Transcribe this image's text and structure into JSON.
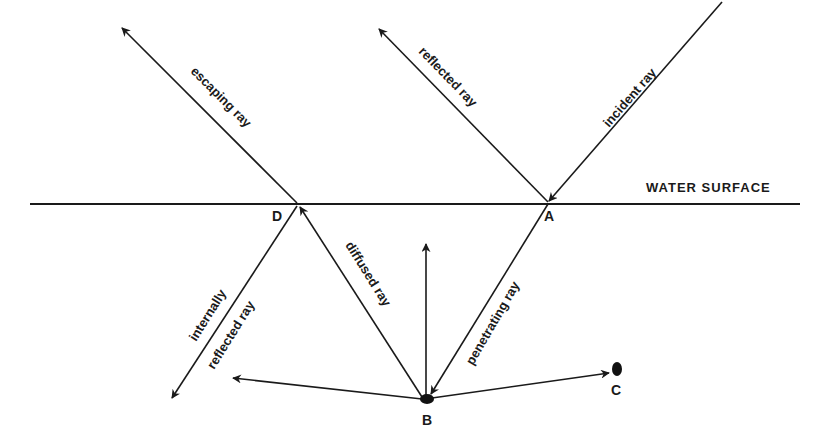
{
  "diagram": {
    "type": "light ray paths at water surface",
    "surface_label": "WATER SURFACE",
    "points": {
      "A": "A",
      "B": "B",
      "C": "C",
      "D": "D"
    },
    "rays": {
      "incident": "incident ray",
      "reflected": "reflected ray",
      "escaping": "escaping ray",
      "penetrating": "penetrating ray",
      "diffused": "diffused ray",
      "internally_line1": "internally",
      "internally_line2": "reflected ray"
    },
    "colors": {
      "line": "#1a1a1a",
      "background": "#ffffff"
    }
  }
}
